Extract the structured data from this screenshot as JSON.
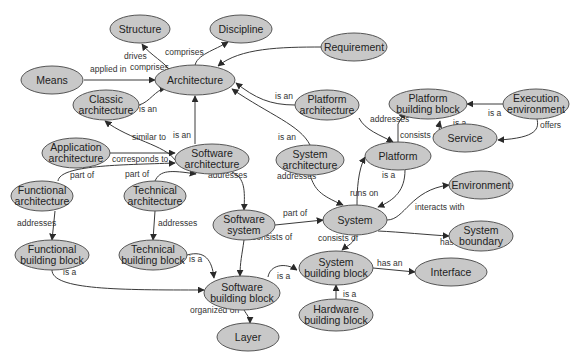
{
  "diagram": {
    "type": "concept-map",
    "style": {
      "node_fill": "#c8c8c8",
      "node_stroke": "#555555",
      "edge_color": "#3a3a3a",
      "background": "#ffffff"
    },
    "nodes": [
      {
        "id": "structure",
        "lines": [
          "Structure"
        ]
      },
      {
        "id": "discipline",
        "lines": [
          "Discipline"
        ]
      },
      {
        "id": "requirement",
        "lines": [
          "Requirement"
        ]
      },
      {
        "id": "means",
        "lines": [
          "Means"
        ]
      },
      {
        "id": "architecture",
        "lines": [
          "Architecture"
        ]
      },
      {
        "id": "classic_architecture",
        "lines": [
          "Classic",
          "architecture"
        ]
      },
      {
        "id": "platform_architecture",
        "lines": [
          "Platform",
          "architecture"
        ]
      },
      {
        "id": "platform_building_block",
        "lines": [
          "Platform",
          "building block"
        ]
      },
      {
        "id": "execution_environment",
        "lines": [
          "Execution",
          "environment"
        ]
      },
      {
        "id": "service",
        "lines": [
          "Service"
        ]
      },
      {
        "id": "application_architecture",
        "lines": [
          "Application",
          "architecture"
        ]
      },
      {
        "id": "software_architecture",
        "lines": [
          "Software",
          "architecture"
        ]
      },
      {
        "id": "system_architecture",
        "lines": [
          "System",
          "architecture"
        ]
      },
      {
        "id": "platform",
        "lines": [
          "Platform"
        ]
      },
      {
        "id": "environment",
        "lines": [
          "Environment"
        ]
      },
      {
        "id": "functional_architecture",
        "lines": [
          "Functional",
          "architecture"
        ]
      },
      {
        "id": "technical_architecture",
        "lines": [
          "Technical",
          "architecture"
        ]
      },
      {
        "id": "software_system",
        "lines": [
          "Software",
          "system"
        ]
      },
      {
        "id": "system",
        "lines": [
          "System"
        ]
      },
      {
        "id": "system_boundary",
        "lines": [
          "System",
          "boundary"
        ]
      },
      {
        "id": "functional_building_block",
        "lines": [
          "Functional",
          "building block"
        ]
      },
      {
        "id": "technical_building_block",
        "lines": [
          "Technical",
          "building block"
        ]
      },
      {
        "id": "software_building_block",
        "lines": [
          "Software",
          "building block"
        ]
      },
      {
        "id": "system_building_block",
        "lines": [
          "System",
          "building block"
        ]
      },
      {
        "id": "interface",
        "lines": [
          "Interface"
        ]
      },
      {
        "id": "hardware_building_block",
        "lines": [
          "Hardware",
          "building block"
        ]
      },
      {
        "id": "layer",
        "lines": [
          "Layer"
        ]
      }
    ],
    "edges": [
      {
        "from": "architecture",
        "to": "structure",
        "label": "comprises"
      },
      {
        "from": "architecture",
        "to": "discipline",
        "label": "comprises"
      },
      {
        "from": "requirement",
        "to": "architecture",
        "label": "drives"
      },
      {
        "from": "means",
        "to": "architecture",
        "label": "applied in"
      },
      {
        "from": "classic_architecture",
        "to": "architecture",
        "label": "is an"
      },
      {
        "from": "platform_architecture",
        "to": "architecture",
        "label": "is an"
      },
      {
        "from": "software_architecture",
        "to": "architecture",
        "label": "is an"
      },
      {
        "from": "system_architecture",
        "to": "architecture",
        "label": "is an"
      },
      {
        "from": "software_architecture",
        "to": "classic_architecture",
        "label": "similar to"
      },
      {
        "from": "application_architecture",
        "to": "software_architecture",
        "label": "corresponds to"
      },
      {
        "from": "functional_architecture",
        "to": "software_architecture",
        "label": "part of"
      },
      {
        "from": "technical_architecture",
        "to": "software_architecture",
        "label": "part of"
      },
      {
        "from": "software_architecture",
        "to": "software_system",
        "label": "addresses"
      },
      {
        "from": "platform_architecture",
        "to": "platform",
        "label": "addresses"
      },
      {
        "from": "system_architecture",
        "to": "system",
        "label": "addresses"
      },
      {
        "from": "platform",
        "to": "platform_building_block",
        "label": "consists of"
      },
      {
        "from": "execution_environment",
        "to": "platform_building_block",
        "label": "is a"
      },
      {
        "from": "service",
        "to": "platform_building_block",
        "label": "is a"
      },
      {
        "from": "execution_environment",
        "to": "service",
        "label": "offers"
      },
      {
        "from": "system",
        "to": "platform",
        "label": "runs on"
      },
      {
        "from": "platform",
        "to": "system",
        "label": "is a"
      },
      {
        "from": "system",
        "to": "environment",
        "label": "interacts with"
      },
      {
        "from": "system",
        "to": "system_boundary",
        "label": "has a"
      },
      {
        "from": "software_system",
        "to": "system",
        "label": "part of"
      },
      {
        "from": "system",
        "to": "system_building_block",
        "label": "consists of"
      },
      {
        "from": "software_system",
        "to": "software_building_block",
        "label": "consists of"
      },
      {
        "from": "functional_architecture",
        "to": "functional_building_block",
        "label": "addresses"
      },
      {
        "from": "technical_architecture",
        "to": "technical_building_block",
        "label": "addresses"
      },
      {
        "from": "functional_building_block",
        "to": "software_building_block",
        "label": "is a"
      },
      {
        "from": "technical_building_block",
        "to": "software_building_block",
        "label": "is a"
      },
      {
        "from": "software_building_block",
        "to": "system_building_block",
        "label": "is a"
      },
      {
        "from": "hardware_building_block",
        "to": "system_building_block",
        "label": "is a"
      },
      {
        "from": "system_building_block",
        "to": "interface",
        "label": "has an"
      },
      {
        "from": "software_building_block",
        "to": "layer",
        "label": "organized on"
      }
    ]
  }
}
